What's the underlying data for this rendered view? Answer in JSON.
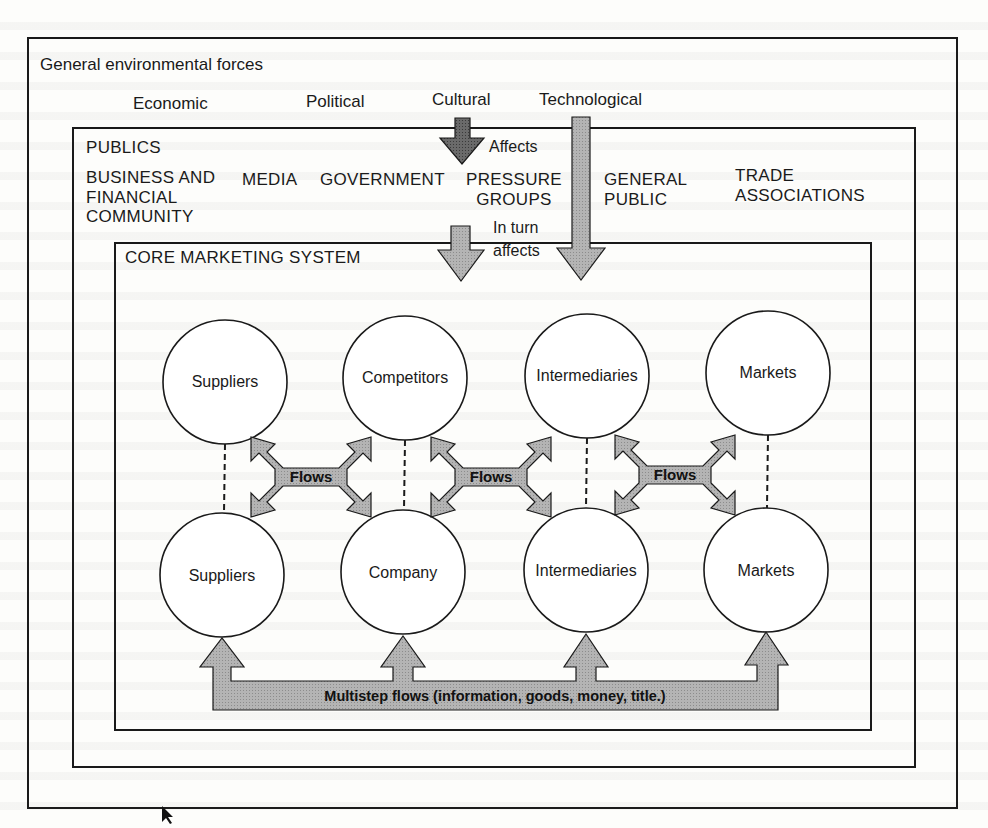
{
  "environment": {
    "title": "General environmental forces",
    "forces": [
      "Economic",
      "Political",
      "Cultural",
      "Technological"
    ]
  },
  "publics": {
    "title": "PUBLICS",
    "groups": [
      {
        "line1": "BUSINESS AND",
        "line2": "FINANCIAL",
        "line3": "COMMUNITY"
      },
      {
        "line1": "MEDIA"
      },
      {
        "line1": "GOVERNMENT"
      },
      {
        "line1": "PRESSURE",
        "line2": "GROUPS"
      },
      {
        "line1": "GENERAL",
        "line2": "PUBLIC"
      },
      {
        "line1": "TRADE",
        "line2": "ASSOCIATIONS"
      }
    ]
  },
  "annotations": {
    "affects": "Affects",
    "in_turn": "In turn",
    "affects2": "affects"
  },
  "core": {
    "title": "CORE MARKETING SYSTEM",
    "top_row": [
      "Suppliers",
      "Competitors",
      "Intermediaries",
      "Markets"
    ],
    "bottom_row": [
      "Suppliers",
      "Company",
      "Intermediaries",
      "Markets"
    ],
    "flow_label": "Flows",
    "flows": [
      "Flows",
      "Flows",
      "Flows"
    ],
    "multistep_label": "Multistep flows (information, goods, money, title.)"
  },
  "colors": {
    "line": "#1a1a1a",
    "arrow_fill": "#a9a9a9",
    "arrow_dark": "#5a5a5a",
    "background": "#fdfdfb"
  }
}
